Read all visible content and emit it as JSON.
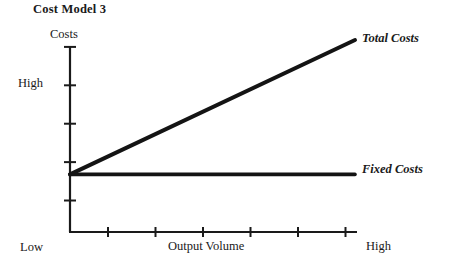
{
  "title": "Cost Model 3",
  "chart_data": {
    "type": "line",
    "title": "Cost Model 3",
    "xlabel": "Output Volume",
    "ylabel": "Costs",
    "x_tick_labels": [
      "Low",
      "High"
    ],
    "y_tick_labels": [
      "High"
    ],
    "grid": false,
    "legend_position": "right-inline",
    "xlim": [
      0,
      6
    ],
    "ylim": [
      0,
      5
    ],
    "x_tick_count": 6,
    "y_tick_count": 5,
    "series": [
      {
        "name": "Total Costs",
        "points": [
          [
            0,
            1.5
          ],
          [
            6,
            5.0
          ]
        ],
        "color": "#141414",
        "width": 4
      },
      {
        "name": "Fixed Costs",
        "points": [
          [
            0,
            1.5
          ],
          [
            6,
            1.5
          ]
        ],
        "color": "#141414",
        "width": 3.6
      }
    ]
  },
  "axes": {
    "y_title": "Costs",
    "y_high_label": "High",
    "y_low_label": "Low",
    "x_title": "Output Volume",
    "x_high_label": "High",
    "axis_color": "#1a1a1a"
  },
  "labels": {
    "total_costs": "Total Costs",
    "fixed_costs": "Fixed Costs"
  }
}
